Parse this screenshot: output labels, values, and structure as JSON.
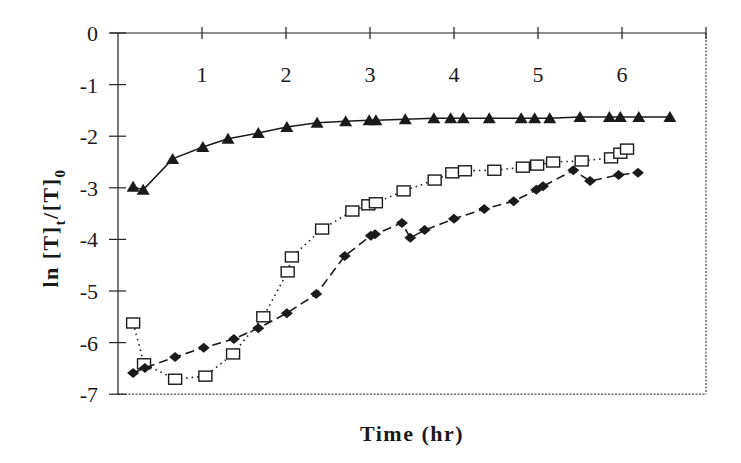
{
  "chart_data": {
    "type": "line",
    "title": "",
    "xlabel": "Time (hr)",
    "ylabel": "ln [T]t/[T]0",
    "ylabel_parts": {
      "main": "ln [T]",
      "sub1": "t",
      "mid": "/[T]",
      "sub2": "0"
    },
    "xlim": [
      0,
      7
    ],
    "ylim": [
      -7,
      0
    ],
    "x_ticks": [
      1,
      2,
      3,
      4,
      5,
      6
    ],
    "x_tick_labels": [
      "1",
      "2",
      "3",
      "4",
      "5",
      "6"
    ],
    "y_ticks": [
      0,
      -1,
      -2,
      -3,
      -4,
      -5,
      -6,
      -7
    ],
    "y_tick_labels": [
      "0",
      "-1",
      "-2",
      "-3",
      "-4",
      "-5",
      "-6",
      "-7"
    ],
    "x_axis_position": "top",
    "grid": false,
    "legend": null,
    "series": [
      {
        "name": "triangles",
        "marker": "triangle-filled",
        "line": "solid",
        "color": "#1a1a1a",
        "x": [
          0.18,
          0.3,
          0.65,
          1.01,
          1.31,
          1.67,
          2.01,
          2.37,
          2.71,
          2.99,
          3.07,
          3.42,
          3.76,
          3.96,
          4.11,
          4.42,
          4.8,
          4.96,
          5.14,
          5.5,
          5.85,
          5.98,
          6.2,
          6.57
        ],
        "y": [
          -2.98,
          -3.04,
          -2.44,
          -2.21,
          -2.05,
          -1.94,
          -1.82,
          -1.74,
          -1.71,
          -1.69,
          -1.69,
          -1.67,
          -1.65,
          -1.65,
          -1.65,
          -1.65,
          -1.65,
          -1.65,
          -1.65,
          -1.63,
          -1.63,
          -1.63,
          -1.63,
          -1.63
        ]
      },
      {
        "name": "open squares",
        "marker": "square-open",
        "line": "dotted",
        "color": "#1a1a1a",
        "x": [
          0.18,
          0.31,
          0.68,
          1.04,
          1.37,
          1.73,
          2.02,
          2.07,
          2.43,
          2.79,
          2.98,
          3.07,
          3.4,
          3.77,
          3.98,
          4.13,
          4.48,
          4.82,
          4.99,
          5.18,
          5.52,
          5.87,
          5.98,
          6.06
        ],
        "y": [
          -5.62,
          -6.41,
          -6.71,
          -6.65,
          -6.22,
          -5.5,
          -4.63,
          -4.34,
          -3.8,
          -3.45,
          -3.33,
          -3.29,
          -3.06,
          -2.85,
          -2.71,
          -2.67,
          -2.66,
          -2.6,
          -2.56,
          -2.5,
          -2.48,
          -2.42,
          -2.33,
          -2.25
        ]
      },
      {
        "name": "diamonds",
        "marker": "diamond-filled",
        "line": "dashed",
        "color": "#1a1a1a",
        "x": [
          0.18,
          0.32,
          0.68,
          1.02,
          1.38,
          1.67,
          2.01,
          2.36,
          2.7,
          3.01,
          3.06,
          3.38,
          3.48,
          3.65,
          4.0,
          4.36,
          4.71,
          4.98,
          5.06,
          5.42,
          5.62,
          5.96,
          6.19
        ],
        "y": [
          -6.59,
          -6.49,
          -6.28,
          -6.1,
          -5.93,
          -5.72,
          -5.43,
          -5.06,
          -4.32,
          -3.93,
          -3.9,
          -3.68,
          -3.97,
          -3.82,
          -3.6,
          -3.41,
          -3.26,
          -3.04,
          -2.97,
          -2.66,
          -2.87,
          -2.75,
          -2.71
        ]
      }
    ]
  }
}
